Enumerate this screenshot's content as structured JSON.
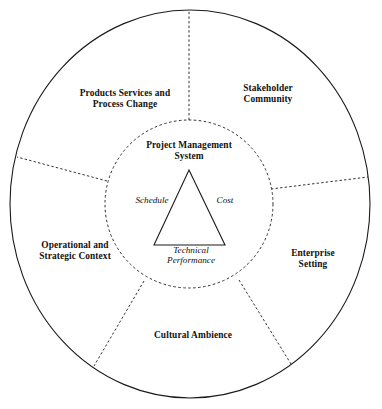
{
  "diagram": {
    "type": "concentric-circle-sector-diagram",
    "colors": {
      "stroke": "#1a1a1a",
      "background": "#ffffff",
      "text": "#111111"
    },
    "core": {
      "label": "Project Management\nSystem",
      "shape": "dashed-circle"
    },
    "triangle": {
      "shape": "solid-triangle",
      "vertices_labels": [
        {
          "name": "schedule",
          "text": "Schedule",
          "position": "left"
        },
        {
          "name": "cost",
          "text": "Cost",
          "position": "right"
        },
        {
          "name": "technical-performance",
          "text": "Technical\nPerformance",
          "position": "bottom"
        }
      ]
    },
    "outer_ring": {
      "shape": "solid-circle",
      "divider_style": "dashed",
      "sectors": [
        {
          "name": "products-services-and-process-change",
          "label": "Products Services and\nProcess Change",
          "position": "upper-left"
        },
        {
          "name": "stakeholder-community",
          "label": "Stakeholder\nCommunity",
          "position": "upper-right"
        },
        {
          "name": "enterprise-setting",
          "label": "Enterprise Setting",
          "position": "right"
        },
        {
          "name": "cultural-ambience",
          "label": "Cultural Ambience",
          "position": "bottom"
        },
        {
          "name": "operational-and-strategic-context",
          "label": "Operational and\nStrategic Context",
          "position": "left"
        }
      ]
    }
  }
}
